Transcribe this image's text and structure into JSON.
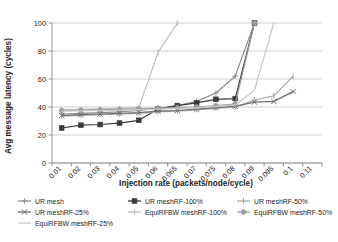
{
  "chart_data": {
    "type": "line",
    "title": "",
    "xlabel": "Injection rate (packets/node/cycle)",
    "ylabel": "Avg message latency (cycles)",
    "x": [
      0.01,
      0.02,
      0.03,
      0.04,
      0.05,
      0.06,
      0.065,
      0.07,
      0.075,
      0.08,
      0.09,
      0.095,
      0.1,
      0.11
    ],
    "xtick_labels": [
      "0.01",
      "0.02",
      "0.03",
      "0.04",
      "0.05",
      "0.06",
      "0.065",
      "0.07",
      "0.075",
      "0.08",
      "0.09",
      "0.095",
      "0.1",
      "0.11"
    ],
    "ytick_labels": [
      "0",
      "20",
      "40",
      "60",
      "80",
      "100"
    ],
    "yticks": [
      0,
      20,
      40,
      60,
      80,
      100
    ],
    "ylim": [
      0,
      100
    ],
    "grid": true,
    "legend_position": "bottom",
    "series": [
      {
        "name": "UR mesh",
        "color": "#8f8f8f",
        "marker": "plus",
        "values": [
          35,
          35.5,
          36,
          36.5,
          37.5,
          39,
          41,
          44,
          50,
          62,
          100,
          null,
          null,
          null
        ]
      },
      {
        "name": "UR meshRF-100%",
        "color": "#3a3a3a",
        "marker": "square",
        "values": [
          25,
          27,
          27.5,
          28.5,
          30.5,
          38.5,
          41,
          43,
          45.5,
          46,
          100,
          null,
          null,
          null
        ]
      },
      {
        "name": "UR meshRF-50%",
        "color": "#a8a8a8",
        "marker": "tick",
        "values": [
          33.5,
          34,
          34.5,
          35,
          35.5,
          36.5,
          37,
          38,
          39,
          40,
          45,
          48,
          62,
          null
        ]
      },
      {
        "name": "UR meshRF-25%",
        "color": "#6d6d6d",
        "marker": "x",
        "values": [
          34,
          34.5,
          35,
          35.5,
          36,
          37,
          37.5,
          38.5,
          39.5,
          40.5,
          43.5,
          44,
          51,
          null
        ]
      },
      {
        "name": "EquiRFBW meshRF-100%",
        "color": "#bdbdbd",
        "marker": "tick",
        "values": [
          38,
          38.3,
          38.6,
          39,
          39.5,
          79,
          100,
          null,
          null,
          null,
          null,
          null,
          null,
          null
        ]
      },
      {
        "name": "EquiRFBW meshRF-50%",
        "color": "#9a9a9a",
        "marker": "circle",
        "values": [
          37.5,
          37.8,
          38,
          38.3,
          38.7,
          39.2,
          39.6,
          40,
          41,
          42,
          100,
          null,
          null,
          null
        ]
      },
      {
        "name": "EquiRFBW meshRF-25%",
        "color": "#c8c8c8",
        "marker": "none",
        "values": [
          37,
          37.2,
          37.5,
          37.8,
          38.1,
          38.5,
          39,
          39.5,
          40.5,
          41.5,
          52,
          100,
          null,
          null
        ]
      }
    ]
  },
  "legend": {
    "items": [
      {
        "label": "UR mesh"
      },
      {
        "label": "UR meshRF-100%"
      },
      {
        "label": "UR meshRF-50%"
      },
      {
        "label": "UR meshRF-25%"
      },
      {
        "label": "EquiRFBW meshRF-100%"
      },
      {
        "label": "EquiRFBW meshRF-50%"
      },
      {
        "label": "EquiRFBW meshRF-25%"
      }
    ]
  }
}
